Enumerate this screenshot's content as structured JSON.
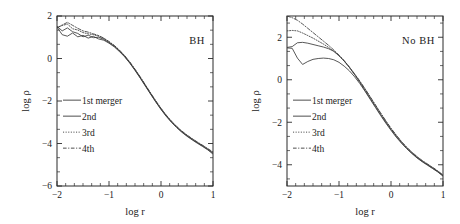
{
  "figure": {
    "width": 460,
    "height": 224,
    "background": "#ffffff",
    "ink_color": "#3a3a3a"
  },
  "axis_titles": {
    "x": "log r",
    "y": "log ρ"
  },
  "legend": {
    "entries": [
      {
        "label": "1st merger",
        "style": "solid"
      },
      {
        "label": "2nd",
        "style": "solid"
      },
      {
        "label": "3rd",
        "style": "dotted"
      },
      {
        "label": "4th",
        "style": "dashdot"
      }
    ]
  },
  "chart_data": [
    {
      "type": "line",
      "panel_id": "BH",
      "title": "BH",
      "annotation": "BH",
      "xlabel": "log r",
      "ylabel": "log ρ",
      "xlim": [
        -2,
        1
      ],
      "ylim": [
        -6,
        2
      ],
      "xticks": [
        -2,
        -1,
        0,
        1
      ],
      "yticks": [
        -6,
        -4,
        -2,
        0,
        2
      ],
      "xminor_per_interval": 5,
      "yminor_per_interval": 2,
      "grid": false,
      "legend_position": "center-left",
      "x": [
        -2.0,
        -1.9,
        -1.8,
        -1.7,
        -1.6,
        -1.5,
        -1.4,
        -1.3,
        -1.2,
        -1.1,
        -1.0,
        -0.9,
        -0.8,
        -0.7,
        -0.6,
        -0.5,
        -0.4,
        -0.3,
        -0.2,
        -0.1,
        0.0,
        0.1,
        0.2,
        0.3,
        0.4,
        0.5,
        0.6,
        0.7,
        0.8,
        0.9,
        1.0
      ],
      "series": [
        {
          "name": "1st merger",
          "style": "solid",
          "values": [
            1.48,
            1.12,
            1.05,
            1.2,
            1.02,
            1.09,
            0.96,
            1.04,
            0.92,
            0.86,
            0.72,
            0.55,
            0.33,
            0.08,
            -0.22,
            -0.56,
            -0.92,
            -1.3,
            -1.68,
            -2.05,
            -2.4,
            -2.72,
            -3.0,
            -3.25,
            -3.47,
            -3.66,
            -3.83,
            -3.99,
            -4.14,
            -4.3,
            -4.5
          ]
        },
        {
          "name": "2nd",
          "style": "solid",
          "values": [
            1.52,
            1.3,
            1.44,
            1.26,
            1.18,
            1.02,
            1.1,
            0.98,
            1.0,
            0.9,
            0.75,
            0.58,
            0.36,
            0.1,
            -0.2,
            -0.54,
            -0.9,
            -1.28,
            -1.66,
            -2.03,
            -2.38,
            -2.7,
            -2.98,
            -3.23,
            -3.45,
            -3.64,
            -3.81,
            -3.97,
            -4.12,
            -4.28,
            -4.46
          ]
        },
        {
          "name": "3rd",
          "style": "dotted",
          "values": [
            1.46,
            1.55,
            1.62,
            1.4,
            1.34,
            1.22,
            1.16,
            1.12,
            1.05,
            0.94,
            0.78,
            0.6,
            0.38,
            0.12,
            -0.18,
            -0.52,
            -0.88,
            -1.26,
            -1.64,
            -2.01,
            -2.36,
            -2.68,
            -2.96,
            -3.21,
            -3.43,
            -3.62,
            -3.79,
            -3.95,
            -4.1,
            -4.26,
            -4.44
          ]
        },
        {
          "name": "4th",
          "style": "dashdot",
          "values": [
            1.44,
            1.58,
            1.7,
            1.56,
            1.42,
            1.3,
            1.24,
            1.16,
            1.08,
            0.96,
            0.8,
            0.62,
            0.4,
            0.14,
            -0.16,
            -0.5,
            -0.86,
            -1.24,
            -1.62,
            -1.99,
            -2.34,
            -2.66,
            -2.94,
            -3.19,
            -3.41,
            -3.6,
            -3.77,
            -3.93,
            -4.08,
            -4.24,
            -4.4
          ]
        }
      ]
    },
    {
      "type": "line",
      "panel_id": "NoBH",
      "title": "No BH",
      "annotation": "No BH",
      "xlabel": "log r",
      "ylabel": "log ρ",
      "xlim": [
        -2,
        1
      ],
      "ylim": [
        -5,
        3
      ],
      "xticks": [
        -2,
        -1,
        0,
        1
      ],
      "yticks": [
        -4,
        -2,
        0,
        2
      ],
      "xminor_per_interval": 5,
      "yminor_per_interval": 2,
      "grid": false,
      "legend_position": "center-left",
      "x": [
        -2.0,
        -1.9,
        -1.8,
        -1.7,
        -1.6,
        -1.5,
        -1.4,
        -1.3,
        -1.2,
        -1.1,
        -1.0,
        -0.9,
        -0.8,
        -0.7,
        -0.6,
        -0.5,
        -0.4,
        -0.3,
        -0.2,
        -0.1,
        0.0,
        0.1,
        0.2,
        0.3,
        0.4,
        0.5,
        0.6,
        0.7,
        0.8,
        0.9,
        1.0
      ],
      "series": [
        {
          "name": "1st merger",
          "style": "solid",
          "values": [
            1.5,
            1.48,
            1.02,
            0.72,
            0.86,
            0.96,
            1.0,
            1.02,
            1.0,
            0.94,
            0.82,
            0.64,
            0.42,
            0.14,
            -0.18,
            -0.54,
            -0.92,
            -1.3,
            -1.68,
            -2.04,
            -2.38,
            -2.7,
            -2.98,
            -3.24,
            -3.47,
            -3.68,
            -3.86,
            -4.02,
            -4.18,
            -4.34,
            -4.54
          ]
        },
        {
          "name": "2nd",
          "style": "solid",
          "values": [
            1.52,
            1.56,
            1.74,
            1.76,
            1.72,
            1.66,
            1.6,
            1.54,
            1.46,
            1.34,
            1.14,
            0.88,
            0.58,
            0.24,
            -0.12,
            -0.5,
            -0.88,
            -1.26,
            -1.64,
            -2.0,
            -2.34,
            -2.66,
            -2.96,
            -3.22,
            -3.45,
            -3.66,
            -3.84,
            -4.0,
            -4.16,
            -4.32,
            -4.52
          ]
        },
        {
          "name": "3rd",
          "style": "dotted",
          "values": [
            2.3,
            2.32,
            2.3,
            2.2,
            2.08,
            1.96,
            1.82,
            1.68,
            1.52,
            1.34,
            1.12,
            0.88,
            0.58,
            0.26,
            -0.08,
            -0.44,
            -0.82,
            -1.2,
            -1.58,
            -1.95,
            -2.3,
            -2.62,
            -2.92,
            -3.19,
            -3.42,
            -3.63,
            -3.82,
            -3.98,
            -4.14,
            -4.31,
            -4.5
          ]
        },
        {
          "name": "4th",
          "style": "dashdot",
          "values": [
            3.0,
            2.92,
            2.8,
            2.62,
            2.42,
            2.22,
            2.02,
            1.82,
            1.62,
            1.4,
            1.16,
            0.9,
            0.6,
            0.28,
            -0.06,
            -0.42,
            -0.8,
            -1.18,
            -1.56,
            -1.93,
            -2.28,
            -2.6,
            -2.9,
            -3.17,
            -3.4,
            -3.61,
            -3.8,
            -3.96,
            -4.12,
            -4.29,
            -4.48
          ]
        }
      ]
    }
  ]
}
